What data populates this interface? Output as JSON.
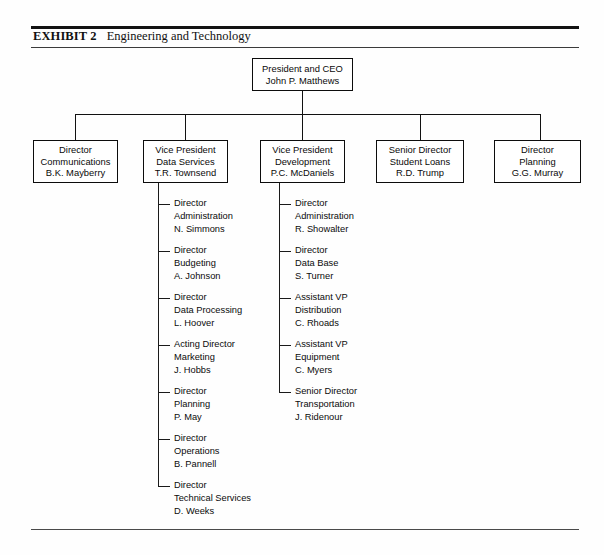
{
  "exhibit": {
    "label": "EXHIBIT 2",
    "title": "Engineering and Technology"
  },
  "chart": {
    "type": "org-chart",
    "root": {
      "title": "President and CEO",
      "name": "John P. Matthews"
    },
    "level2": [
      {
        "role": "Director",
        "unit": "Communications",
        "name": "B.K. Mayberry"
      },
      {
        "role": "Vice President",
        "unit": "Data Services",
        "name": "T.R. Townsend"
      },
      {
        "role": "Vice President",
        "unit": "Development",
        "name": "P.C. McDaniels"
      },
      {
        "role": "Senior Director",
        "unit": "Student Loans",
        "name": "R.D. Trump"
      },
      {
        "role": "Director",
        "unit": "Planning",
        "name": "G.G. Murray"
      }
    ],
    "data_services_reports": [
      {
        "role": "Director",
        "unit": "Administration",
        "name": "N. Simmons"
      },
      {
        "role": "Director",
        "unit": "Budgeting",
        "name": "A. Johnson"
      },
      {
        "role": "Director",
        "unit": "Data Processing",
        "name": "L. Hoover"
      },
      {
        "role": "Acting Director",
        "unit": "Marketing",
        "name": "J. Hobbs"
      },
      {
        "role": "Director",
        "unit": "Planning",
        "name": "P. May"
      },
      {
        "role": "Director",
        "unit": "Operations",
        "name": "B. Pannell"
      },
      {
        "role": "Director",
        "unit": "Technical Services",
        "name": "D. Weeks"
      }
    ],
    "development_reports": [
      {
        "role": "Director",
        "unit": "Administration",
        "name": "R. Showalter"
      },
      {
        "role": "Director",
        "unit": "Data Base",
        "name": "S. Turner"
      },
      {
        "role": "Assistant VP",
        "unit": "Distribution",
        "name": "C. Rhoads"
      },
      {
        "role": "Assistant VP",
        "unit": "Equipment",
        "name": "C. Myers"
      },
      {
        "role": "Senior Director",
        "unit": "Transportation",
        "name": "J. Ridenour"
      }
    ]
  }
}
